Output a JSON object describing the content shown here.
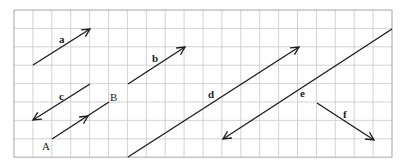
{
  "diagram": {
    "type": "vector-grid",
    "grid": {
      "origin_x": 14,
      "origin_y": 10,
      "cell_w": 18.9,
      "cell_h": 18.4,
      "cols": 20,
      "rows": 8,
      "line_color": "#c8c8c8",
      "border_color": "#b0b0b0"
    },
    "stroke_color": "#1a1a1a",
    "vectors": [
      {
        "id": "a",
        "label": "a",
        "x1": 33,
        "y1": 65,
        "x2": 90,
        "y2": 29,
        "arrow": "end",
        "lx": 59,
        "ly": 43,
        "bold": true
      },
      {
        "id": "b",
        "label": "b",
        "x1": 128,
        "y1": 84,
        "x2": 185,
        "y2": 47,
        "arrow": "end",
        "lx": 152,
        "ly": 62,
        "bold": true
      },
      {
        "id": "c",
        "label": "c",
        "x1": 90,
        "y1": 84,
        "x2": 33,
        "y2": 120,
        "arrow": "end",
        "lx": 59,
        "ly": 100,
        "bold": true
      },
      {
        "id": "AB",
        "label": "",
        "x1": 52,
        "y1": 139,
        "x2": 109,
        "y2": 102,
        "arrow": "mid",
        "mx": 88,
        "my": 116,
        "lx": 0,
        "ly": 0,
        "bold": false
      },
      {
        "id": "d",
        "label": "d",
        "x1": 128,
        "y1": 157,
        "x2": 299,
        "y2": 47,
        "arrow": "end",
        "lx": 208,
        "ly": 98,
        "bold": true
      },
      {
        "id": "e",
        "label": "e",
        "x1": 392,
        "y1": 29,
        "x2": 223,
        "y2": 139,
        "arrow": "end",
        "lx": 300,
        "ly": 97,
        "bold": true
      },
      {
        "id": "f",
        "label": "f",
        "x1": 317,
        "y1": 103,
        "x2": 374,
        "y2": 140,
        "arrow": "end",
        "lx": 343,
        "ly": 118,
        "bold": true
      }
    ],
    "points": [
      {
        "label": "A",
        "x": 42,
        "y": 150
      },
      {
        "label": "B",
        "x": 110,
        "y": 101
      }
    ]
  }
}
